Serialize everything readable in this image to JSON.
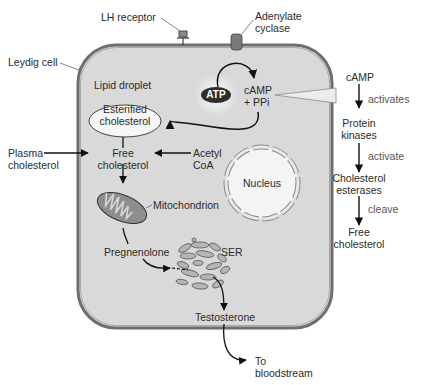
{
  "labels": {
    "lh_receptor": "LH receptor",
    "adenylate_cyclase_line1": "Adenylate",
    "adenylate_cyclase_line2": "cyclase",
    "leydig_cell": "Leydig cell",
    "lipid_droplet": "Lipid droplet",
    "esterified_line1": "Esterified",
    "esterified_line2": "cholesterol",
    "atp": "ATP",
    "camp_line1": "cAMP",
    "camp_line2": "+ PPi",
    "plasma_line1": "Plasma",
    "plasma_line2": "cholesterol",
    "free_line1": "Free",
    "free_line2": "cholesterol",
    "acetyl_line1": "Acetyl",
    "acetyl_line2": "CoA",
    "nucleus": "Nucleus",
    "mitochondrion": "Mitochondrion",
    "pregnenolone": "Pregnenolone",
    "ser": "SER",
    "testosterone": "Testosterone",
    "bloodstream_line1": "To",
    "bloodstream_line2": "bloodstream"
  },
  "panel": {
    "camp": "cAMP",
    "activates": "activates",
    "protein_line1": "Protein",
    "protein_line2": "kinases",
    "activate": "activate",
    "esterases_line1": "Cholesterol",
    "esterases_line2": "esterases",
    "cleave": "cleave",
    "free_line1": "Free",
    "free_line2": "cholesterol"
  },
  "colors": {
    "cell_fill": "#d9d9d9",
    "membrane": "#6e6e6e",
    "panel_fill": "#ececec",
    "organelle_fill": "#9a9a9a",
    "atp_fill": "#2e2e2e"
  }
}
